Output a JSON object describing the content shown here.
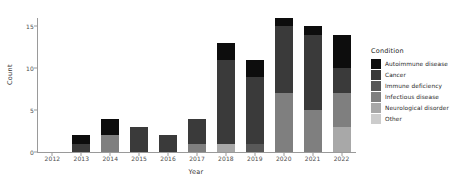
{
  "chart_data": {
    "type": "bar",
    "stacked": true,
    "title": "",
    "xlabel": "Year",
    "ylabel": "Count",
    "categories": [
      "2012",
      "2013",
      "2014",
      "2015",
      "2016",
      "2017",
      "2018",
      "2019",
      "2020",
      "2021",
      "2022"
    ],
    "ylim": [
      0,
      16
    ],
    "yticks": [
      0,
      5,
      10,
      15
    ],
    "grid": false,
    "legend": {
      "title": "Condition",
      "position": "right",
      "entries": [
        {
          "name": "Autoimmune disease",
          "color": "#0d0d0d"
        },
        {
          "name": "Cancer",
          "color": "#3a3a3a"
        },
        {
          "name": "Immune deficiency",
          "color": "#585858"
        },
        {
          "name": "Infectious disease",
          "color": "#7f7f7f"
        },
        {
          "name": "Neurological disorder",
          "color": "#a8a8a8"
        },
        {
          "name": "Other",
          "color": "#cccccc"
        }
      ]
    },
    "series": [
      {
        "name": "Autoimmune disease",
        "color": "#0d0d0d",
        "values": [
          0,
          1,
          2,
          0,
          0,
          0,
          2,
          2,
          1,
          1,
          4
        ]
      },
      {
        "name": "Cancer",
        "color": "#3a3a3a",
        "values": [
          0,
          1,
          0,
          3,
          2,
          3,
          10,
          8,
          8,
          9,
          3
        ]
      },
      {
        "name": "Immune deficiency",
        "color": "#585858",
        "values": [
          0,
          0,
          0,
          0,
          0,
          0,
          0,
          1,
          0,
          0,
          0
        ]
      },
      {
        "name": "Infectious disease",
        "color": "#7f7f7f",
        "values": [
          0,
          0,
          2,
          0,
          0,
          1,
          0,
          0,
          7,
          5,
          4
        ]
      },
      {
        "name": "Neurological disorder",
        "color": "#a8a8a8",
        "values": [
          0,
          0,
          0,
          0,
          0,
          0,
          1,
          0,
          0,
          0,
          3
        ]
      },
      {
        "name": "Other",
        "color": "#cccccc",
        "values": [
          0,
          0,
          0,
          0,
          0,
          0,
          0,
          0,
          0,
          0,
          0
        ]
      }
    ],
    "totals": [
      0,
      2,
      4,
      3,
      2,
      4,
      13,
      11,
      16,
      15,
      14
    ]
  }
}
